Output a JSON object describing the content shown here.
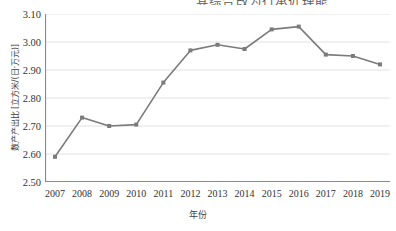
{
  "page": {
    "clipped_header_text": "其综合改为行承近理能",
    "clipped_header_marker": "legend-dot"
  },
  "chart_data": {
    "type": "line",
    "title": "",
    "xlabel": "年份",
    "ylabel": "数产产出比 [立方米/(日·万元)]",
    "categories": [
      "2007",
      "2008",
      "2009",
      "2010",
      "2011",
      "2012",
      "2013",
      "2014",
      "2015",
      "2016",
      "2017",
      "2018",
      "2019"
    ],
    "values": [
      2.59,
      2.73,
      2.7,
      2.705,
      2.855,
      2.97,
      2.99,
      2.975,
      3.045,
      3.055,
      2.955,
      2.95,
      2.92
    ],
    "ylim": [
      2.5,
      3.1
    ],
    "ytick_step": 0.1,
    "yticks": [
      "2.50",
      "2.60",
      "2.70",
      "2.80",
      "2.90",
      "3.00",
      "3.10"
    ],
    "ytick_values": [
      2.5,
      2.6,
      2.7,
      2.8,
      2.9,
      3.0,
      3.1
    ],
    "grid": "horizontal",
    "legend": "none",
    "series_color": "#7b7b7b",
    "marker": "square",
    "marker_size": 4,
    "line_width": 1.6,
    "gridline_color": "#e2e2e2",
    "axis_color": "#8a8a8a"
  }
}
